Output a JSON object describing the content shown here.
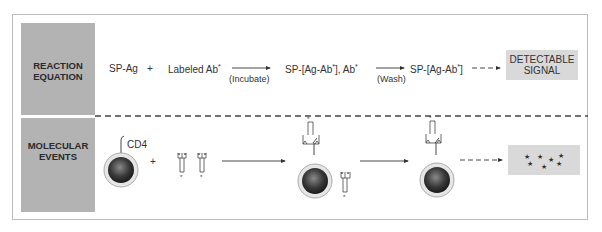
{
  "sections": {
    "reaction": {
      "label_line1": "REACTION",
      "label_line2": "EQUATION"
    },
    "molecular": {
      "label_line1": "MOLECULAR",
      "label_line2": "EVENTS"
    }
  },
  "equation": {
    "term1": "SP-Ag",
    "plus": "+",
    "term2": "Labeled Ab",
    "step1_label": "(Incubate)",
    "term3_a": "SP-[Ag-Ab",
    "term3_b": "], Ab",
    "step2_label": "(Wash)",
    "term4_a": "SP-[Ag-Ab",
    "term4_b": "]",
    "star": "*",
    "result_line1": "DETECTABLE",
    "result_line2": "SIGNAL"
  },
  "molecular": {
    "receptor_label": "CD4",
    "plus": "+",
    "signal_stars": "★"
  },
  "colors": {
    "sidebar": "#b3b3b3",
    "signal_box": "#d9d9d9",
    "frame": "#bdbdbd",
    "line": "#333333"
  }
}
